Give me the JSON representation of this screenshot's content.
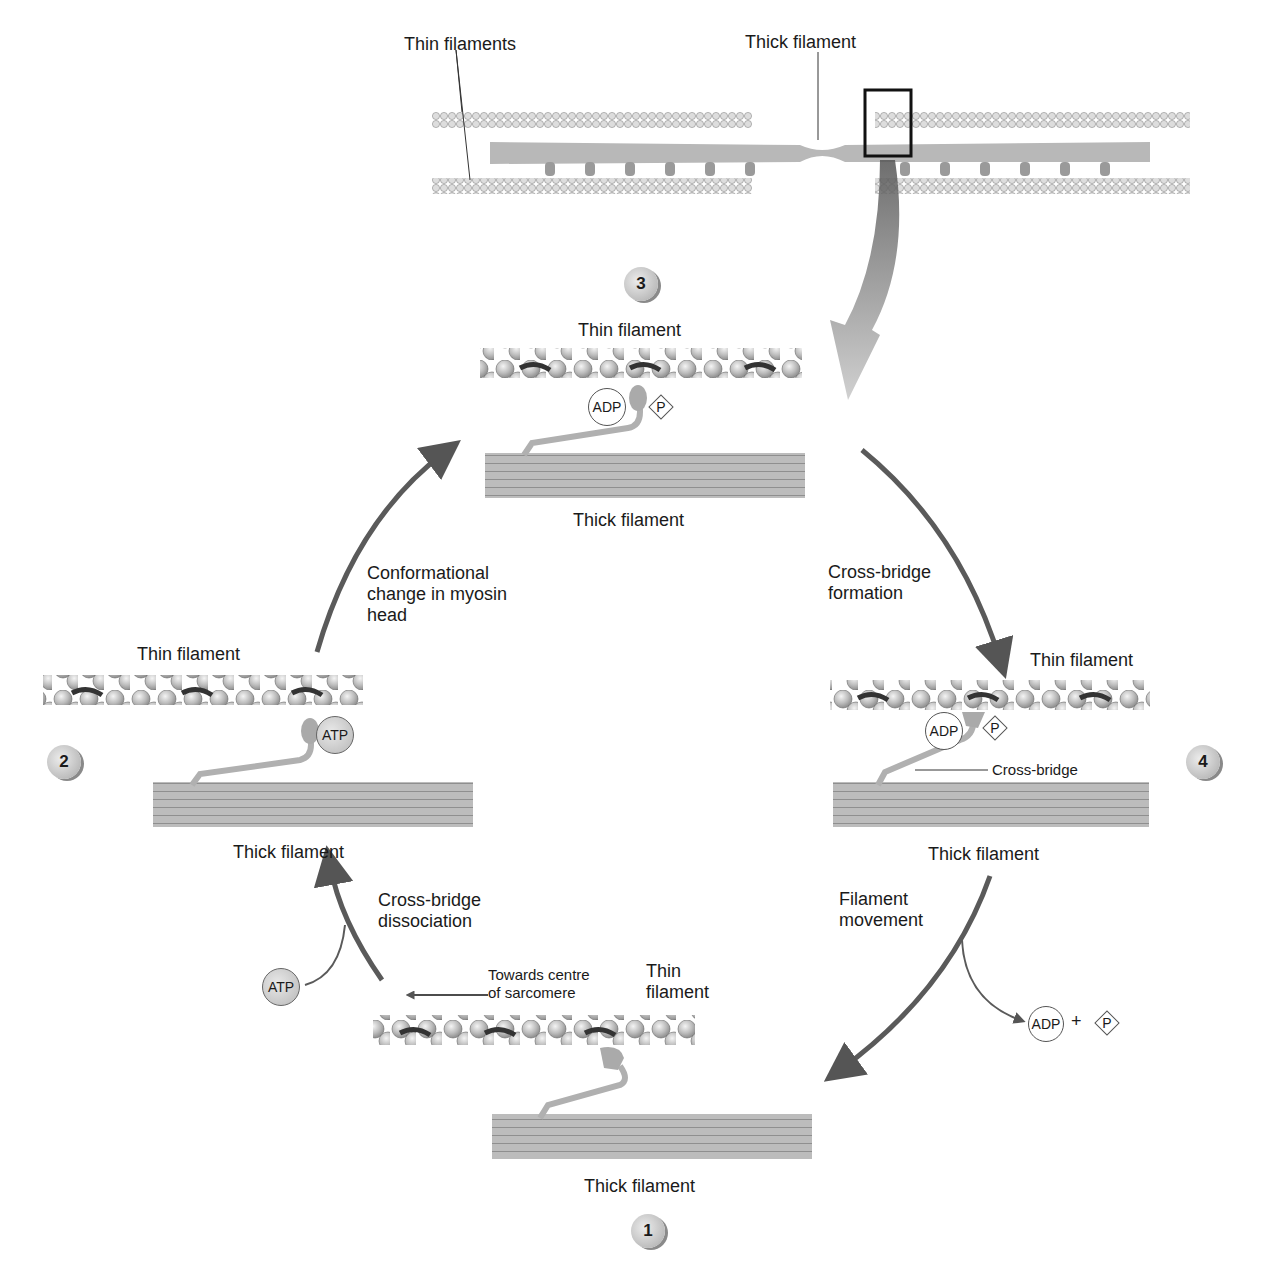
{
  "overview": {
    "thin_filaments_label": "Thin filaments",
    "thick_filament_label": "Thick filament"
  },
  "steps": [
    {
      "number": "1",
      "thin_label": "Thin\nfilament",
      "thick_label": "Thick filament",
      "direction_label": "Towards centre\nof sarcomere"
    },
    {
      "number": "2",
      "thin_label": "Thin filament",
      "thick_label": "Thick filament",
      "bound_molecule": "ATP"
    },
    {
      "number": "3",
      "thin_label": "Thin filament",
      "thick_label": "Thick filament",
      "bound_molecules": [
        "ADP",
        "P"
      ]
    },
    {
      "number": "4",
      "thin_label": "Thin filament",
      "thick_label": "Thick filament",
      "bound_molecules": [
        "ADP",
        "P"
      ],
      "cross_bridge_label": "Cross-bridge"
    }
  ],
  "transitions": {
    "dissociation": {
      "label": "Cross-bridge\ndissociation",
      "input": "ATP"
    },
    "conformational": {
      "label": "Conformational\nchange in myosin\nhead"
    },
    "formation": {
      "label": "Cross-bridge\nformation"
    },
    "movement": {
      "label": "Filament\nmovement",
      "outputs": [
        "ADP",
        "+",
        "P"
      ]
    }
  },
  "colors": {
    "arrow": "#5a5a5a",
    "filament": "#b5b5b5",
    "bead": "#c8c8c8",
    "tropomyosin": "#3a3a3a"
  }
}
